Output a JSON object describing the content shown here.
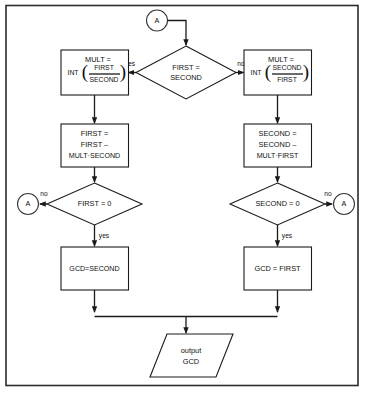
{
  "diagram": {
    "colors": {
      "stroke": "#1a1a1a",
      "frame": "#2b2b2b",
      "fill": "#ffffff"
    },
    "connector_top": {
      "label": "A"
    },
    "connector_left": {
      "label": "A"
    },
    "connector_right": {
      "label": "A"
    },
    "decision_top": {
      "line1": "FIRST =",
      "line2": "SECOND"
    },
    "mult_left": {
      "line1": "MULT =",
      "prefix": "INT",
      "numerator": "FIRST",
      "denominator": "SECOND"
    },
    "mult_right": {
      "line1": "MULT =",
      "prefix": "INT",
      "numerator": "SECOND",
      "denominator": "FIRST"
    },
    "process_left": {
      "line1": "FIRST =",
      "line2": "FIRST –",
      "line3": "MULT·SECOND"
    },
    "process_right": {
      "line1": "SECOND =",
      "line2": "SECOND –",
      "line3": "MULT·FIRST"
    },
    "decision_left": {
      "label": "FIRST = 0"
    },
    "decision_right": {
      "label": "SECOND = 0"
    },
    "gcd_left": {
      "label": "GCD=SECOND"
    },
    "gcd_right": {
      "label": "GCD = FIRST"
    },
    "output": {
      "line1": "output",
      "line2": "GCD"
    },
    "labels": {
      "yes_top_left": "yes",
      "no_top_right": "no",
      "no_left": "no",
      "no_right": "no",
      "yes_left": "yes",
      "yes_right": "yes"
    }
  }
}
